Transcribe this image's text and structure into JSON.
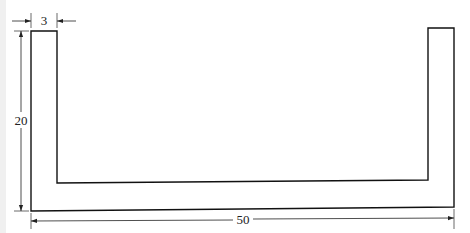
{
  "diagram": {
    "type": "technical-drawing",
    "shape": "U-channel cross-section",
    "line_color": "#111111",
    "dimension_color": "#222222",
    "dimensions": {
      "wall_thickness": {
        "label": "3"
      },
      "height": {
        "label": "20"
      },
      "width": {
        "label": "50"
      }
    }
  }
}
